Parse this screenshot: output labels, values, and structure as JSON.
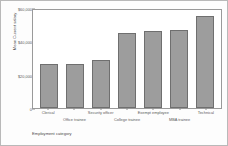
{
  "chart_data": {
    "type": "bar",
    "title": "",
    "xlabel": "Employment category",
    "ylabel": "Mean Current salary",
    "categories": [
      "Clerical",
      "Office trainee",
      "Security officer",
      "College trainee",
      "Exempt employee",
      "MBA trainee",
      "Technical"
    ],
    "values": [
      26500,
      26300,
      28700,
      44800,
      46500,
      47000,
      55500
    ],
    "ylim": [
      0,
      60000
    ],
    "yticks": [
      0,
      20000,
      40000,
      60000
    ],
    "ytick_labels": [
      "0",
      "$20,000",
      "$40,000",
      "$60,000"
    ],
    "grid": false,
    "legend": false,
    "bar_color": "#9d9d9d",
    "bar_edge_color": "#6f6f6f"
  }
}
